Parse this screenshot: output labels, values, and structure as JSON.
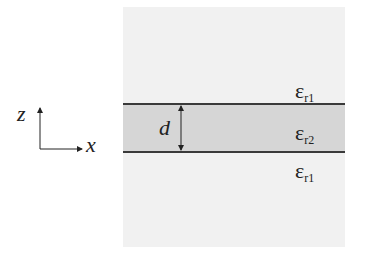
{
  "diagram": {
    "axes": {
      "vertical_label": "z",
      "horizontal_label": "x"
    },
    "thickness_label": "d",
    "regions": [
      {
        "name": "upper-cladding",
        "symbol": "ε",
        "subscript": "r1"
      },
      {
        "name": "core-layer",
        "symbol": "ε",
        "subscript": "r2"
      },
      {
        "name": "lower-cladding",
        "symbol": "ε",
        "subscript": "r1"
      }
    ],
    "colors": {
      "cladding": "#f1f1f1",
      "core": "#d6d6d6",
      "boundary": "#3a3a3a",
      "ink": "#222222"
    }
  }
}
